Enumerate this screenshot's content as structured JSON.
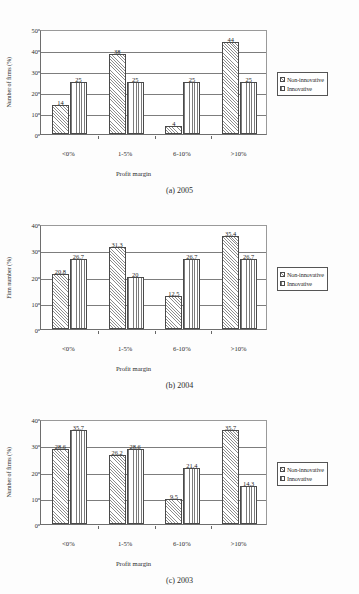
{
  "document": {
    "background_color": "#fdfdfd",
    "series_colors": {
      "non_innovative": "#8d8d8d",
      "innovative": "#7b7b7b"
    }
  },
  "legend": {
    "non_innovative_label": "Non-innovative",
    "innovative_label": "Innovative",
    "non_innovative_icon": "diagonal-hatch-swatch",
    "innovative_icon": "vertical-lines-swatch"
  },
  "captions": {
    "a": "(a) 2005",
    "b": "(b) 2004",
    "c": "(c) 2003"
  },
  "chart_data": [
    {
      "id": "chart-2005",
      "type": "bar",
      "title": "(a) 2005",
      "xlabel": "Profit margin",
      "ylabel": "Number of firms (%)",
      "categories": [
        "<0%",
        "1-5%",
        "6-10%",
        ">10%"
      ],
      "ylim": [
        0,
        50
      ],
      "yticks": [
        0,
        10,
        20,
        30,
        40,
        50
      ],
      "grid": true,
      "legend_position": "right",
      "series": [
        {
          "name": "Non-innovative",
          "values": [
            14,
            38,
            4,
            44
          ]
        },
        {
          "name": "Innovative",
          "values": [
            25,
            25,
            25,
            25
          ]
        }
      ],
      "data_labels": {
        "non_innovative": [
          "14",
          "38",
          "4",
          "44"
        ],
        "innovative": [
          "25",
          "25",
          "25",
          "25"
        ]
      }
    },
    {
      "id": "chart-2004",
      "type": "bar",
      "title": "(b) 2004",
      "xlabel": "Profit margin",
      "ylabel": "Firm number (%)",
      "categories": [
        "<0%",
        "1-5%",
        "6-10%",
        ">10%"
      ],
      "ylim": [
        0,
        40
      ],
      "yticks": [
        0,
        10,
        20,
        30,
        40
      ],
      "grid": true,
      "legend_position": "right",
      "series": [
        {
          "name": "Non-innovative",
          "values": [
            20.8,
            31.3,
            12.5,
            35.4
          ]
        },
        {
          "name": "Innovative",
          "values": [
            26.7,
            20,
            26.7,
            26.7
          ]
        }
      ],
      "data_labels": {
        "non_innovative": [
          "20.8",
          "31.3",
          "12.5",
          "35.4"
        ],
        "innovative": [
          "26.7",
          "20",
          "26.7",
          "26.7"
        ]
      }
    },
    {
      "id": "chart-2003",
      "type": "bar",
      "title": "(c) 2003",
      "xlabel": "Profit margin",
      "ylabel": "Number of firms (%)",
      "categories": [
        "<0%",
        "1-5%",
        "6-10%",
        ">10%"
      ],
      "ylim": [
        0,
        40
      ],
      "yticks": [
        0,
        10,
        20,
        30,
        40
      ],
      "grid": true,
      "legend_position": "right",
      "series": [
        {
          "name": "Non-innovative",
          "values": [
            28.6,
            26.2,
            9.5,
            35.7
          ]
        },
        {
          "name": "Innovative",
          "values": [
            35.7,
            28.6,
            21.4,
            14.3
          ]
        }
      ],
      "data_labels": {
        "non_innovative": [
          "28.6",
          "26.2",
          "9.5",
          "35.7"
        ],
        "innovative": [
          "35.7",
          "28.6",
          "21.4",
          "14.3"
        ]
      }
    }
  ]
}
